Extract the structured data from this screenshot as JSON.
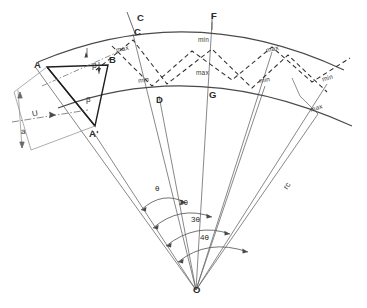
{
  "figure": {
    "background_color": "#ffffff",
    "line_color": "#555555",
    "solid_line_color": "#4a4a4a",
    "dashed_line_color": "#333333",
    "text_color": "#2b2b2b",
    "apex_label": "O"
  },
  "points": [
    {
      "id": "A",
      "label": "A",
      "x": 38,
      "y": 66
    },
    {
      "id": "B",
      "label": "B",
      "x": 104,
      "y": 62
    },
    {
      "id": "Ap",
      "label": "A'",
      "x": 92,
      "y": 130
    },
    {
      "id": "Ctop",
      "label": "C",
      "x": 137,
      "y": 18
    },
    {
      "id": "C",
      "label": "C",
      "x": 133,
      "y": 34
    },
    {
      "id": "D",
      "label": "D",
      "x": 159,
      "y": 96
    },
    {
      "id": "F",
      "label": "F",
      "x": 213,
      "y": 17
    },
    {
      "id": "G",
      "label": "G",
      "x": 212,
      "y": 92
    },
    {
      "id": "O",
      "label": "O",
      "x": 196,
      "y": 290
    }
  ],
  "extrema_labels": [
    {
      "text": "max",
      "x": 124,
      "y": 50
    },
    {
      "text": "min",
      "x": 145,
      "y": 80
    },
    {
      "text": "min",
      "x": 204,
      "y": 41
    },
    {
      "text": "max",
      "x": 203,
      "y": 73
    },
    {
      "text": "max",
      "x": 272,
      "y": 51
    },
    {
      "text": "min",
      "x": 265,
      "y": 80
    },
    {
      "text": "min",
      "x": 328,
      "y": 78
    },
    {
      "text": "max",
      "x": 318,
      "y": 109
    }
  ],
  "angle_labels": [
    {
      "text": "θ",
      "x": 157,
      "y": 188
    },
    {
      "text": "2θ",
      "x": 183,
      "y": 203
    },
    {
      "text": "3θ",
      "x": 194,
      "y": 219
    },
    {
      "text": "4θ",
      "x": 203,
      "y": 238
    }
  ],
  "dimension_labels": [
    {
      "text": "U",
      "x": 33,
      "y": 114,
      "kind": "velocity-vector"
    },
    {
      "text": "a",
      "x": 22,
      "y": 131,
      "kind": "pitch-dimension"
    }
  ],
  "radius_label": {
    "text": "rc",
    "x": 286,
    "y": 186
  },
  "triangle_angles": [
    {
      "text": "β",
      "x": 93,
      "y": 67,
      "name": "beta-angle"
    },
    {
      "text": "β",
      "x": 88,
      "y": 100,
      "name": "beta-angle-lower"
    }
  ]
}
